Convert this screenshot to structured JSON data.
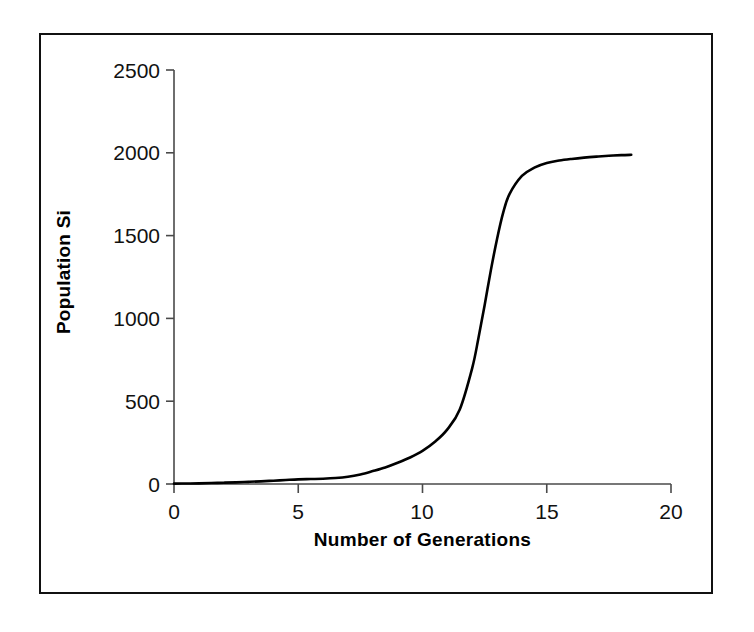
{
  "chart_data": {
    "type": "line",
    "title": "",
    "xlabel": "Number of Generations",
    "ylabel": "Population Si",
    "xlim": [
      0,
      20
    ],
    "ylim": [
      0,
      2500
    ],
    "xticks": [
      "0",
      "5",
      "10",
      "15",
      "20"
    ],
    "xtick_values": [
      0,
      5,
      10,
      15,
      20
    ],
    "yticks": [
      "0",
      "500",
      "1000",
      "1500",
      "2000",
      "2500"
    ],
    "ytick_values": [
      0,
      500,
      1000,
      1500,
      2000,
      2500
    ],
    "grid": false,
    "legend": false,
    "legend_position": "none",
    "line_color": "#000000",
    "series": [
      {
        "name": "Population Si",
        "x": [
          0,
          0.5,
          1,
          1.5,
          2,
          2.5,
          3,
          3.5,
          4,
          4.5,
          5,
          5.5,
          6,
          6.5,
          7,
          7.5,
          8,
          8.5,
          9,
          9.5,
          10,
          10.5,
          11,
          11.5,
          12,
          12.25,
          12.5,
          12.75,
          13,
          13.25,
          13.5,
          14,
          14.5,
          15,
          15.5,
          16,
          16.5,
          17,
          17.5,
          18,
          18.4
        ],
        "y": [
          2,
          3,
          4,
          6,
          8,
          10,
          13,
          16,
          20,
          24,
          28,
          30,
          32,
          36,
          44,
          58,
          78,
          100,
          128,
          160,
          200,
          255,
          330,
          450,
          700,
          880,
          1080,
          1290,
          1480,
          1640,
          1750,
          1860,
          1910,
          1938,
          1953,
          1963,
          1971,
          1977,
          1982,
          1986,
          1988
        ]
      }
    ]
  },
  "axes": {
    "y_tick_labels": [
      "2500",
      "2000",
      "1500",
      "1000",
      "500",
      "0"
    ],
    "x_tick_labels": [
      "0",
      "5",
      "10",
      "15",
      "20"
    ],
    "y_axis_title": "Population Si",
    "x_axis_title": "Number of Generations"
  },
  "colors": {
    "line": "#000000",
    "axis": "#4a4a4a",
    "frame": "#111111",
    "background": "#ffffff",
    "text": "#111111"
  }
}
